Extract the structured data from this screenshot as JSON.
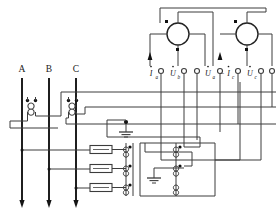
{
  "diagram": {
    "type": "electrical-schematic",
    "line_color": "#3c3c3c",
    "bus_color": "#141414",
    "background": "#ffffff",
    "phase_labels": [
      {
        "id": "A",
        "text": "A",
        "x": 20,
        "y": 72
      },
      {
        "id": "B",
        "text": "B",
        "x": 46,
        "y": 72
      },
      {
        "id": "C",
        "text": "C",
        "x": 73,
        "y": 72
      }
    ],
    "terminal_labels": [
      {
        "id": "ia",
        "base": "I",
        "sub": "a",
        "dot": true,
        "minus": false,
        "x": 150,
        "y": 76
      },
      {
        "id": "ub",
        "base": "U",
        "sub": "b",
        "dot": true,
        "minus": false,
        "x": 172,
        "y": 76
      },
      {
        "id": "ua",
        "base": "U",
        "sub": "a",
        "dot": true,
        "minus": false,
        "x": 208,
        "y": 76
      },
      {
        "id": "nic",
        "base": "I",
        "sub": "c",
        "dot": true,
        "minus": true,
        "x": 226,
        "y": 76
      },
      {
        "id": "uc",
        "base": "U",
        "sub": "c",
        "dot": true,
        "minus": false,
        "x": 249,
        "y": 76
      }
    ],
    "terminals": [
      {
        "id": "t1",
        "x": 161,
        "y": 71
      },
      {
        "id": "t2",
        "x": 184,
        "y": 71
      },
      {
        "id": "t3",
        "x": 197,
        "y": 71
      },
      {
        "id": "t4",
        "x": 220,
        "y": 71
      },
      {
        "id": "t5",
        "x": 238,
        "y": 71
      },
      {
        "id": "t6",
        "x": 261,
        "y": 71
      },
      {
        "id": "t7",
        "x": 272,
        "y": 71
      }
    ],
    "meters": [
      {
        "id": "wattmeter-1",
        "cx": 178,
        "cy": 34,
        "r": 11
      },
      {
        "id": "wattmeter-2",
        "cx": 247,
        "cy": 34,
        "r": 11
      }
    ],
    "current_transformers": [
      {
        "id": "ct-a",
        "phase": "A",
        "x": 32,
        "y": 100
      },
      {
        "id": "ct-c",
        "phase": "C",
        "x": 73,
        "y": 100
      }
    ],
    "fuses": [
      {
        "id": "fuse-1",
        "x": 98,
        "y": 148
      },
      {
        "id": "fuse-2",
        "x": 98,
        "y": 167
      },
      {
        "id": "fuse-3",
        "x": 98,
        "y": 186
      }
    ],
    "voltage_transformer": {
      "id": "vt-three-phase",
      "primary_x": 132,
      "secondary_x": 176,
      "top": 142,
      "bottom": 196
    },
    "grounds": [
      {
        "id": "ground-1",
        "x": 126,
        "y": 126
      },
      {
        "id": "ground-2",
        "x": 154,
        "y": 182
      }
    ],
    "polarity_dot_color": "#111111",
    "notation": {
      "overdot": "phasor",
      "minus_sign": "−"
    }
  }
}
